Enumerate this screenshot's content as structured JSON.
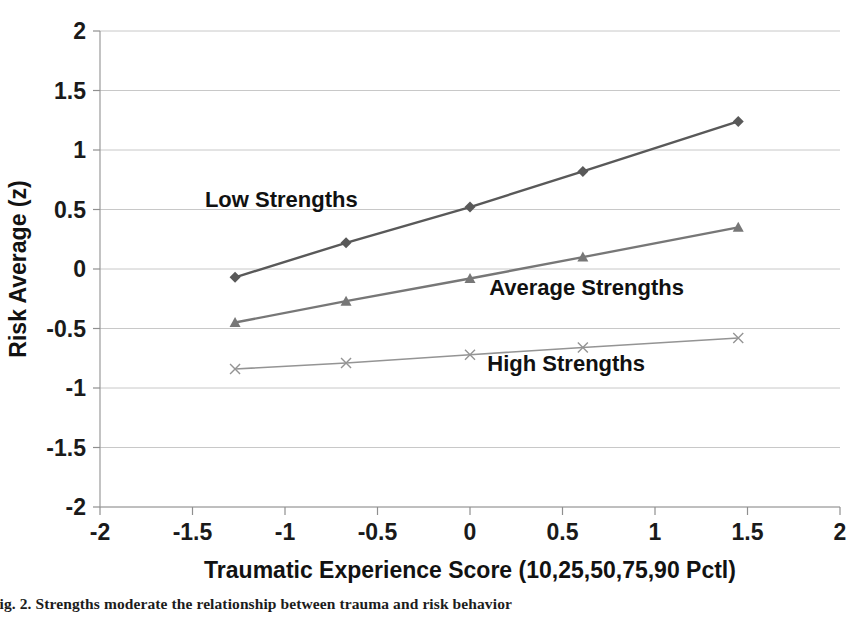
{
  "figure": {
    "caption": "Fig. 2. Strengths moderate the relationship between trauma and risk behavior"
  },
  "chart_data": {
    "type": "line",
    "title": "",
    "xlabel": "Traumatic Experience Score (10,25,50,75,90 Pctl)",
    "ylabel": "Risk Average (z)",
    "xlim": [
      -2,
      2
    ],
    "ylim": [
      -2,
      2
    ],
    "xticks": [
      "-2",
      "-1.5",
      "-1",
      "-0.5",
      "0",
      "0.5",
      "1",
      "1.5",
      "2"
    ],
    "xtick_values": [
      -2,
      -1.5,
      -1,
      -0.5,
      0,
      0.5,
      1,
      1.5,
      2
    ],
    "yticks": [
      "2",
      "1.5",
      "1",
      "0.5",
      "0",
      "-0.5",
      "-1",
      "-1.5",
      "-2"
    ],
    "ytick_values": [
      2,
      1.5,
      1,
      0.5,
      0,
      -0.5,
      -1,
      -1.5,
      -2
    ],
    "grid": "horizontal",
    "legend_position": "inline-annotations",
    "x": [
      -1.27,
      -0.67,
      0,
      0.61,
      1.45
    ],
    "series": [
      {
        "name": "Low Strengths",
        "values": [
          -0.07,
          0.22,
          0.52,
          0.82,
          1.24
        ],
        "color": "#595959",
        "marker": "diamond",
        "label_x": -1.02,
        "label_y": 0.52
      },
      {
        "name": "Average Strengths",
        "values": [
          -0.45,
          -0.27,
          -0.08,
          0.1,
          0.35
        ],
        "color": "#777777",
        "marker": "triangle",
        "label_x": 0.63,
        "label_y": -0.22
      },
      {
        "name": "High Strengths",
        "values": [
          -0.84,
          -0.79,
          -0.72,
          -0.66,
          -0.58
        ],
        "color": "#949494",
        "marker": "cross",
        "label_x": 0.52,
        "label_y": -0.86
      }
    ]
  },
  "axes": {
    "x_title": "Traumatic Experience Score (10,25,50,75,90 Pctl)",
    "y_title": "Risk Average (z)"
  }
}
